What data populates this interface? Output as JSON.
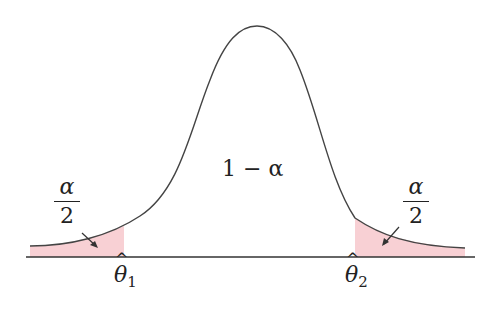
{
  "diagram": {
    "title": "",
    "center_label": "1 − α",
    "left_tail_label": {
      "numerator": "α",
      "denominator": "2"
    },
    "right_tail_label": {
      "numerator": "α",
      "denominator": "2"
    },
    "left_bound": {
      "symbol": "θ",
      "hat": "^",
      "subscript": "1"
    },
    "right_bound": {
      "symbol": "θ",
      "hat": "^",
      "subscript": "2"
    },
    "colors": {
      "curve": "#444444",
      "shade": "#f8d0d4",
      "axis": "#333333",
      "text": "#222222"
    }
  }
}
